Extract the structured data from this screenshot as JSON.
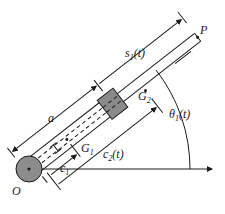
{
  "diagram": {
    "labels": {
      "origin": "O",
      "tip": "P",
      "length_a": "a",
      "s1_main": "s",
      "s1_sub": "1",
      "s1_arg": "(t)",
      "g1_main": "G",
      "g1_sub": "1",
      "g2_main": "G",
      "g2_sub": "2",
      "c1_main": "c",
      "c1_sub": "1",
      "c2_main": "c",
      "c2_sub": "2",
      "c2_arg": "(t)",
      "theta_main": "θ",
      "theta_sub": "1",
      "theta_arg": "(t)"
    },
    "colors": {
      "ink": "#1a1a1a",
      "hub_fill": "#8c8c8c",
      "slider_fill": "#8a8a8a",
      "background": "#ffffff"
    }
  }
}
